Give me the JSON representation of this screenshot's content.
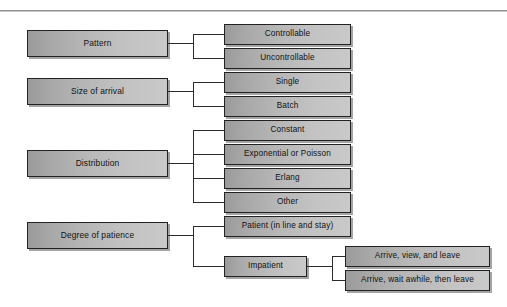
{
  "diagram": {
    "colors": {
      "box_border": "#222222",
      "box_fill_light": "#c9c9c9",
      "box_fill_dark": "#9a9a9a",
      "connector": "#2b2b2b",
      "rule": "#8e8e8e",
      "background": "#ffffff"
    },
    "rule_label": "top-divider-rule",
    "branches": [
      {
        "id": "pattern",
        "label": "Pattern",
        "children": [
          {
            "id": "controllable",
            "label": "Controllable"
          },
          {
            "id": "uncontrollable",
            "label": "Uncontrollable"
          }
        ]
      },
      {
        "id": "size-of-arrival",
        "label": "Size of arrival",
        "children": [
          {
            "id": "single",
            "label": "Single"
          },
          {
            "id": "batch",
            "label": "Batch"
          }
        ]
      },
      {
        "id": "distribution",
        "label": "Distribution",
        "children": [
          {
            "id": "constant",
            "label": "Constant"
          },
          {
            "id": "exponential-or-poisson",
            "label": "Exponential or Poisson"
          },
          {
            "id": "erlang",
            "label": "Erlang"
          },
          {
            "id": "other",
            "label": "Other"
          }
        ]
      },
      {
        "id": "degree-of-patience",
        "label": "Degree of patience",
        "children": [
          {
            "id": "patient",
            "label": "Patient (in line and stay)"
          },
          {
            "id": "impatient",
            "label": "Impatient",
            "children": [
              {
                "id": "arrive-view-and-leave",
                "label": "Arrive, view, and leave"
              },
              {
                "id": "arrive-wait-awhile-then-leave",
                "label": "Arrive, wait awhile, then leave"
              }
            ]
          }
        ]
      }
    ]
  }
}
